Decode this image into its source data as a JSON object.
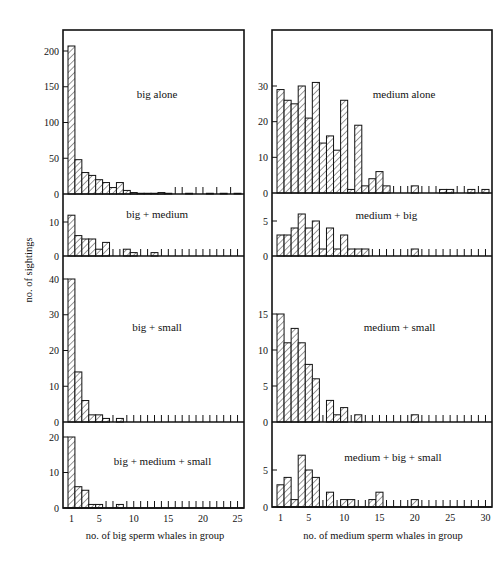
{
  "chart_data": [
    {
      "type": "bar",
      "column": "left",
      "title": "big alone",
      "xlabel": "no. of big sperm whales in group",
      "ylabel": "no. of sightings",
      "x": [
        1,
        2,
        3,
        4,
        5,
        6,
        7,
        8,
        9,
        10,
        11,
        12,
        13,
        14,
        15,
        16,
        17,
        18,
        19,
        20,
        21,
        22,
        23,
        24,
        25
      ],
      "values": [
        207,
        48,
        30,
        26,
        20,
        16,
        9,
        16,
        5,
        2,
        1,
        1,
        1,
        2,
        1,
        0,
        0,
        1,
        0,
        0,
        1,
        0,
        1,
        0,
        1
      ],
      "yticks": [
        0,
        50,
        100,
        150,
        200
      ],
      "ylim": [
        0,
        225
      ],
      "xlim": [
        0.5,
        25.5
      ]
    },
    {
      "type": "bar",
      "column": "left",
      "title": "big + medium",
      "x": [
        1,
        2,
        3,
        4,
        5,
        6,
        7,
        8,
        9,
        10,
        11,
        12,
        13,
        14,
        15,
        16,
        17,
        18,
        19,
        20,
        21,
        22,
        23,
        24,
        25
      ],
      "values": [
        12,
        6,
        5,
        5,
        2,
        4,
        0,
        0,
        2,
        1,
        0,
        0,
        1,
        0,
        0,
        0,
        0,
        0,
        0,
        0,
        0,
        0,
        0,
        0,
        0
      ],
      "yticks": [
        0,
        10
      ],
      "ylim": [
        0,
        16
      ],
      "xlim": [
        0.5,
        25.5
      ]
    },
    {
      "type": "bar",
      "column": "left",
      "title": "big + small",
      "x": [
        1,
        2,
        3,
        4,
        5,
        6,
        7,
        8,
        9,
        10,
        11,
        12,
        13,
        14,
        15,
        16,
        17,
        18,
        19,
        20,
        21,
        22,
        23,
        24,
        25
      ],
      "values": [
        40,
        14,
        6,
        2,
        2,
        1,
        0,
        1,
        0,
        0,
        0,
        0,
        0,
        0,
        0,
        0,
        0,
        0,
        0,
        0,
        0,
        0,
        0,
        0,
        0
      ],
      "yticks": [
        0,
        10,
        20,
        30,
        40
      ],
      "ylim": [
        0,
        46
      ],
      "xlim": [
        0.5,
        25.5
      ]
    },
    {
      "type": "bar",
      "column": "left",
      "title": "big + medium + small",
      "x": [
        1,
        2,
        3,
        4,
        5,
        6,
        7,
        8,
        9,
        10,
        11,
        12,
        13,
        14,
        15,
        16,
        17,
        18,
        19,
        20,
        21,
        22,
        23,
        24,
        25
      ],
      "values": [
        20,
        6,
        5,
        1,
        1,
        0,
        0,
        1,
        0,
        0,
        0,
        0,
        0,
        0,
        0,
        0,
        0,
        0,
        0,
        0,
        0,
        0,
        0,
        0,
        0
      ],
      "yticks": [
        0,
        10,
        20
      ],
      "xticks": [
        1,
        5,
        10,
        15,
        20,
        25
      ],
      "ylim": [
        0,
        24
      ],
      "xlim": [
        0.5,
        25.5
      ]
    },
    {
      "type": "bar",
      "column": "right",
      "title": "medium alone",
      "xlabel": "no. of medium sperm whales in group",
      "x": [
        1,
        2,
        3,
        4,
        5,
        6,
        7,
        8,
        9,
        10,
        11,
        12,
        13,
        14,
        15,
        16,
        17,
        18,
        19,
        20,
        21,
        22,
        23,
        24,
        25,
        26,
        27,
        28,
        29,
        30
      ],
      "values": [
        29,
        26,
        25,
        30,
        21,
        31,
        14,
        16,
        12,
        26,
        1,
        19,
        2,
        4,
        6,
        2,
        0,
        0,
        0,
        2,
        0,
        0,
        0,
        1,
        1,
        0,
        0,
        1,
        0,
        1
      ],
      "yticks": [
        0,
        10,
        20,
        30
      ],
      "ylim": [
        0,
        39
      ],
      "xlim": [
        0.5,
        30.5
      ]
    },
    {
      "type": "bar",
      "column": "right",
      "title": "medium + big",
      "x": [
        1,
        2,
        3,
        4,
        5,
        6,
        7,
        8,
        9,
        10,
        11,
        12,
        13,
        14,
        15,
        16,
        17,
        18,
        19,
        20,
        21,
        22,
        23,
        24,
        25,
        26,
        27,
        28,
        29,
        30
      ],
      "values": [
        3,
        3,
        4,
        6,
        4,
        5,
        1,
        4,
        1,
        3,
        1,
        1,
        1,
        0,
        0,
        0,
        0,
        0,
        0,
        1,
        0,
        0,
        0,
        0,
        0,
        0,
        0,
        0,
        0,
        0
      ],
      "yticks": [
        0,
        5
      ],
      "ylim": [
        0,
        8
      ],
      "xlim": [
        0.5,
        30.5
      ]
    },
    {
      "type": "bar",
      "column": "right",
      "title": "medium + small",
      "x": [
        1,
        2,
        3,
        4,
        5,
        6,
        7,
        8,
        9,
        10,
        11,
        12,
        13,
        14,
        15,
        16,
        17,
        18,
        19,
        20,
        21,
        22,
        23,
        24,
        25,
        26,
        27,
        28,
        29,
        30
      ],
      "values": [
        15,
        11,
        13,
        11,
        8,
        6,
        0,
        3,
        1,
        2,
        0,
        1,
        0,
        0,
        0,
        0,
        0,
        0,
        0,
        1,
        0,
        0,
        0,
        0,
        0,
        0,
        0,
        0,
        0,
        0
      ],
      "yticks": [
        0,
        5,
        10,
        15
      ],
      "ylim": [
        0,
        23
      ],
      "xlim": [
        0.5,
        30.5
      ]
    },
    {
      "type": "bar",
      "column": "right",
      "title": "medium + big + small",
      "x": [
        1,
        2,
        3,
        4,
        5,
        6,
        7,
        8,
        9,
        10,
        11,
        12,
        13,
        14,
        15,
        16,
        17,
        18,
        19,
        20,
        21,
        22,
        23,
        24,
        25,
        26,
        27,
        28,
        29,
        30
      ],
      "values": [
        3,
        4,
        1,
        7,
        5,
        4,
        0,
        2,
        0,
        1,
        1,
        0,
        0,
        1,
        2,
        0,
        0,
        0,
        0,
        1,
        0,
        0,
        0,
        0,
        0,
        0,
        0,
        0,
        0,
        0
      ],
      "yticks": [
        0,
        5
      ],
      "xticks": [
        1,
        5,
        10,
        15,
        20,
        25,
        30
      ],
      "ylim": [
        0,
        12
      ],
      "xlim": [
        0.5,
        30.5
      ]
    }
  ],
  "labels": {
    "ylabel": "no. of sightings",
    "left_xlabel": "no. of big sperm whales in group",
    "right_xlabel": "no. of medium sperm whales in group"
  }
}
